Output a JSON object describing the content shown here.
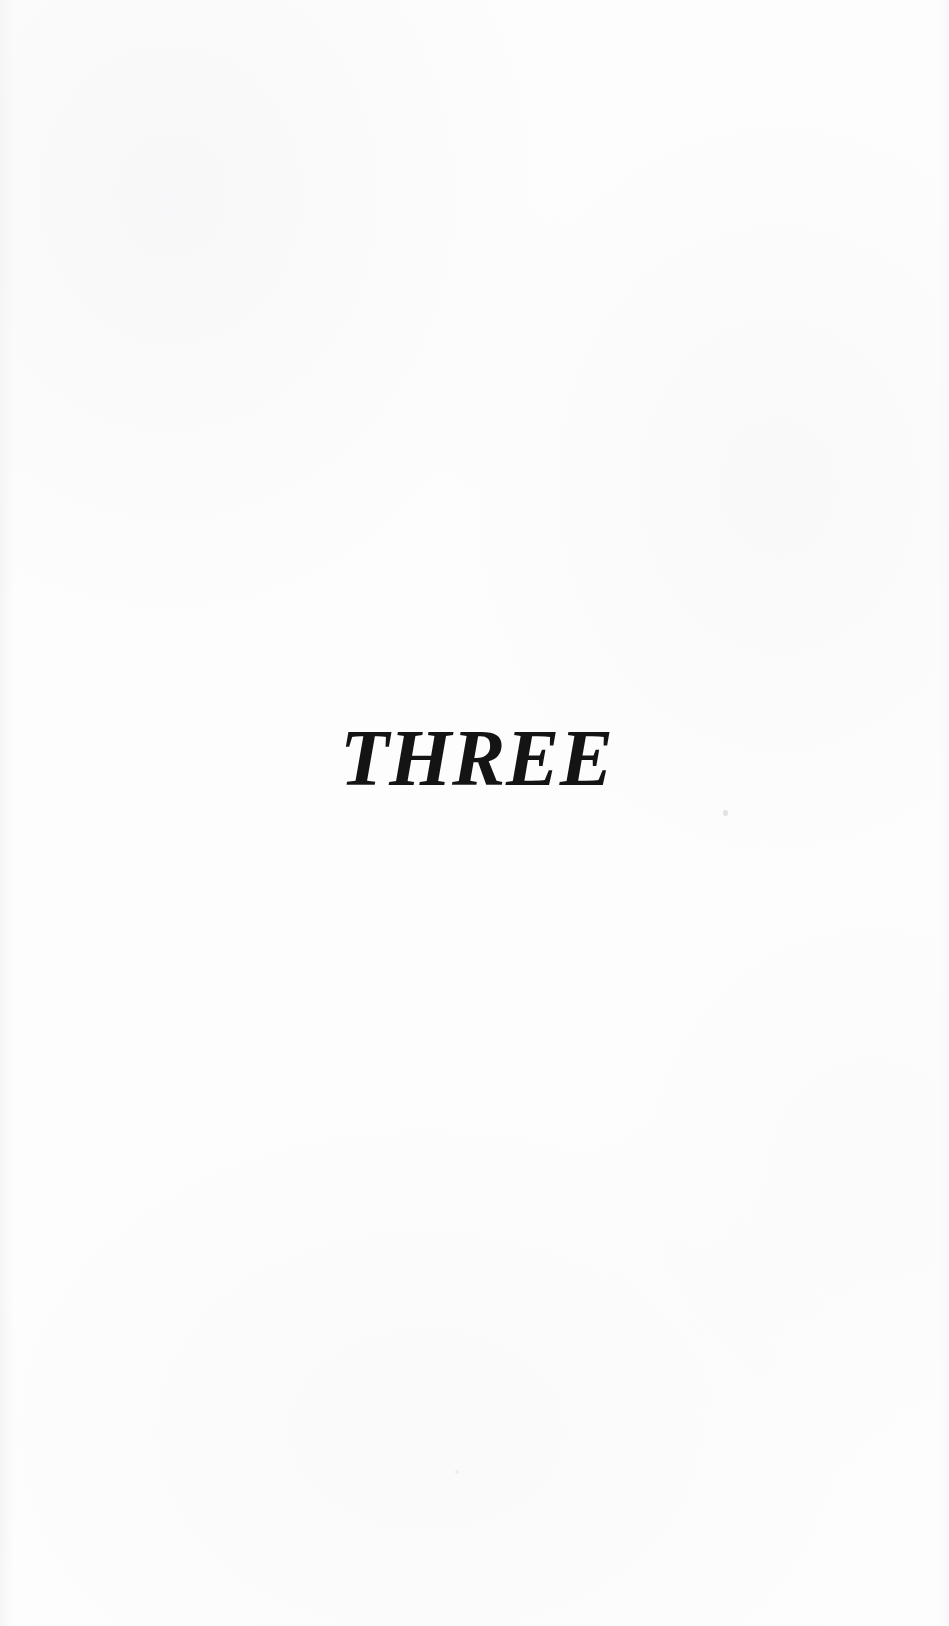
{
  "document": {
    "type": "scanned-book-page",
    "page_width": 949,
    "page_height": 1626,
    "background_color": "#fdfdfd",
    "text_color": "#141414"
  },
  "content": {
    "chapter_label": "THREE"
  },
  "artifacts": {
    "speck_primary": "",
    "speck_secondary": ""
  }
}
